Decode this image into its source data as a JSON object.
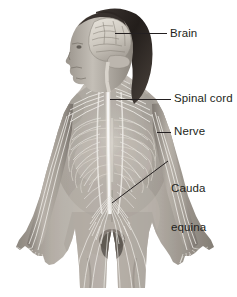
{
  "figure": {
    "background_color": "#ffffff",
    "text_color": "#231f20",
    "nerve_highlight_color": "#f2f0ea",
    "skin_tone_light": "#c9c4bd",
    "skin_tone_mid": "#9b958d",
    "skin_tone_dark": "#6d6861",
    "hair_color": "#2a2522"
  },
  "callouts": [
    {
      "id": "brain",
      "label": "Brain",
      "label_lines": [
        "Brain"
      ],
      "leader": {
        "type": "horizontal",
        "x1": 115,
        "y1": 33,
        "x2": 167,
        "y2": 33
      }
    },
    {
      "id": "spinal-cord",
      "label": "Spinal cord",
      "label_lines": [
        "Spinal cord"
      ],
      "leader": {
        "type": "horizontal",
        "x1": 110,
        "y1": 99,
        "x2": 171,
        "y2": 99
      }
    },
    {
      "id": "nerve",
      "label": "Nerve",
      "label_lines": [
        "Nerve"
      ],
      "leader": {
        "type": "horizontal",
        "x1": 157,
        "y1": 132,
        "x2": 171,
        "y2": 132
      }
    },
    {
      "id": "cauda-equina",
      "label": "Cauda equina",
      "label_lines": [
        "Cauda",
        "equina"
      ],
      "leader": {
        "type": "diagonal",
        "x1": 112,
        "y1": 203,
        "x2": 168,
        "y2": 161
      }
    }
  ],
  "anatomy_parts": [
    {
      "name": "brain",
      "description": "cerebrum with gyri and sulci, cerebellum and brainstem, shown in left lateral profile inside the skull"
    },
    {
      "name": "hair",
      "description": "long dark hair falling behind the head and over the right shoulder"
    },
    {
      "name": "head-profile",
      "description": "face in left profile with cranial nerves visible"
    },
    {
      "name": "spinal-cord",
      "description": "bright vertical cord descending the midline from brainstem to lumbar region"
    },
    {
      "name": "cervical-plexus",
      "description": "nerve branches at the neck"
    },
    {
      "name": "brachial-plexus",
      "description": "nerve network at each shoulder feeding the arms"
    },
    {
      "name": "intercostal-nerves",
      "description": "paired nerves fanning outward along the rib cage"
    },
    {
      "name": "rib-cage",
      "description": "translucent ribs overlaid on the thorax"
    },
    {
      "name": "sympathetic-chain",
      "description": "paired longitudinal nerve trunks flanking the spine"
    },
    {
      "name": "cauda-equina",
      "description": "fan of lumbar and sacral nerve roots below the end of the spinal cord"
    },
    {
      "name": "lumbosacral-plexus",
      "description": "nerve fan in the pelvis supplying the legs"
    },
    {
      "name": "arm-nerves",
      "description": "median, ulnar and radial nerves running down each arm into the hands"
    },
    {
      "name": "leg-nerves",
      "description": "femoral and sciatic nerve branches descending the thighs"
    },
    {
      "name": "hands",
      "description": "open hands with fingers spread, palms forward, at the sides"
    }
  ]
}
